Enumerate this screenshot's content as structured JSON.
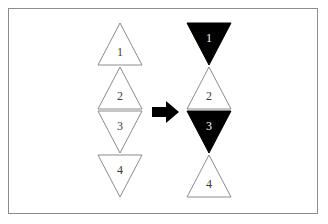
{
  "figure": {
    "canvas": {
      "width": 328,
      "height": 224,
      "background": "#ffffff"
    },
    "border_color": "#8c8c8c",
    "stroke_color": "#8c8c8c",
    "fill_black": "#000000",
    "fill_white": "#ffffff",
    "label_dark_color": "#3a3a3a",
    "label_light_color": "#ffffff",
    "arrow": {
      "icon": "right-arrow-icon",
      "direction": "right",
      "color": "#000000"
    },
    "left_group": {
      "caption": "",
      "triangles": [
        {
          "label": "1",
          "direction": "up",
          "fill": "white",
          "label_color": "dark"
        },
        {
          "label": "2",
          "direction": "up",
          "fill": "white",
          "label_color": "dark"
        },
        {
          "label": "3",
          "direction": "down",
          "fill": "white",
          "label_color": "dark"
        },
        {
          "label": "4",
          "direction": "down",
          "fill": "white",
          "label_color": "dark"
        }
      ]
    },
    "right_group": {
      "caption": "",
      "triangles": [
        {
          "label": "1",
          "direction": "down",
          "fill": "black",
          "label_color": "light"
        },
        {
          "label": "2",
          "direction": "up",
          "fill": "white",
          "label_color": "dark"
        },
        {
          "label": "3",
          "direction": "down",
          "fill": "black",
          "label_color": "light"
        },
        {
          "label": "4",
          "direction": "up",
          "fill": "white",
          "label_color": "dark"
        }
      ]
    }
  }
}
